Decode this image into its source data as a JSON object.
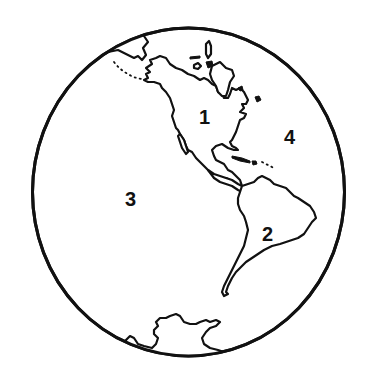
{
  "map": {
    "type": "globe-western-hemisphere",
    "colors": {
      "outline": "#111111",
      "background": "#ffffff"
    },
    "labels": [
      {
        "id": "north-america",
        "text": "1"
      },
      {
        "id": "south-america",
        "text": "2"
      },
      {
        "id": "pacific-ocean",
        "text": "3"
      },
      {
        "id": "atlantic-ocean",
        "text": "4"
      }
    ]
  }
}
